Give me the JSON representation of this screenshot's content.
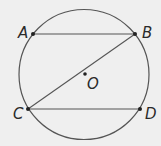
{
  "diagram": {
    "title": "",
    "background": "#efefef",
    "stroke_color": "#555555",
    "circle": {
      "center_label": "O",
      "cx": 84,
      "cy": 74.5,
      "r": 65
    },
    "points": [
      {
        "label": "A",
        "x": 33,
        "y": 34
      },
      {
        "label": "B",
        "x": 135,
        "y": 34
      },
      {
        "label": "C",
        "x": 28,
        "y": 109
      },
      {
        "label": "D",
        "x": 140,
        "y": 109
      },
      {
        "label": "O",
        "x": 85,
        "y": 74
      }
    ],
    "segments": [
      {
        "from": "A",
        "to": "B"
      },
      {
        "from": "B",
        "to": "C"
      },
      {
        "from": "C",
        "to": "D"
      }
    ],
    "labels": {
      "A": "A",
      "B": "B",
      "C": "C",
      "D": "D",
      "O": "O"
    }
  }
}
